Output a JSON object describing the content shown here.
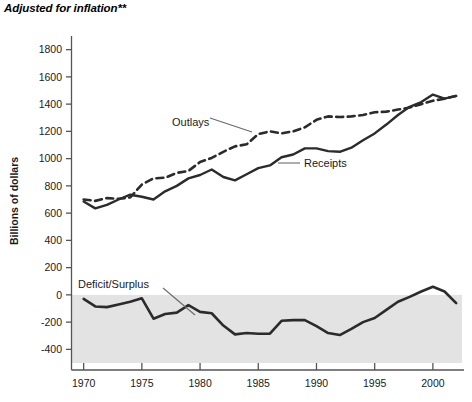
{
  "figure": {
    "title": "Adjusted for inflation**",
    "ylabel": "Billions of dollars"
  },
  "labels": {
    "outlays": "Outlays",
    "receipts": "Receipts",
    "deficit": "Deficit/Surplus"
  },
  "colors": {
    "line": "#2b2b2b",
    "shade": "#e3e3e3",
    "axis": "#555555",
    "text": "#1a1a1a"
  },
  "chart_data": {
    "type": "line",
    "title": "Adjusted for inflation**",
    "xlabel": "",
    "ylabel": "Billions of dollars",
    "xlim": [
      1969,
      2002.5
    ],
    "ylim": [
      -500,
      1900
    ],
    "xticks": [
      1970,
      1975,
      1980,
      1985,
      1990,
      1995,
      2000
    ],
    "xticklabels": [
      "1970",
      "1975",
      "1980",
      "1985",
      "1990",
      "1995",
      "2000"
    ],
    "yticks": [
      -400,
      -200,
      0,
      200,
      400,
      600,
      800,
      1000,
      1200,
      1400,
      1600,
      1800
    ],
    "yticklabels": [
      "-400",
      "-200",
      "0",
      "200",
      "400",
      "600",
      "800",
      "1000",
      "1200",
      "1400",
      "1600",
      "1800"
    ],
    "grid": false,
    "legend": "inline-annotations",
    "shaded_region": {
      "from": 0,
      "to": -500,
      "color": "#e3e3e3"
    },
    "x": [
      1970,
      1971,
      1972,
      1973,
      1974,
      1975,
      1976,
      1977,
      1978,
      1979,
      1980,
      1981,
      1982,
      1983,
      1984,
      1985,
      1986,
      1987,
      1988,
      1989,
      1990,
      1991,
      1992,
      1993,
      1994,
      1995,
      1996,
      1997,
      1998,
      1999,
      2000,
      2001,
      2002
    ],
    "series": [
      {
        "name": "Outlays",
        "style": "dashed",
        "values": [
          700,
          690,
          710,
          705,
          715,
          810,
          855,
          860,
          895,
          910,
          975,
          1005,
          1050,
          1090,
          1105,
          1180,
          1200,
          1185,
          1200,
          1230,
          1285,
          1310,
          1305,
          1310,
          1320,
          1340,
          1345,
          1360,
          1375,
          1400,
          1425,
          1440,
          1460
        ]
      },
      {
        "name": "Receipts",
        "style": "solid",
        "values": [
          685,
          635,
          660,
          700,
          735,
          720,
          700,
          760,
          800,
          855,
          880,
          920,
          865,
          840,
          885,
          930,
          950,
          1010,
          1030,
          1075,
          1075,
          1055,
          1050,
          1080,
          1135,
          1185,
          1250,
          1320,
          1380,
          1415,
          1470,
          1440,
          1460
        ]
      },
      {
        "name": "Deficit/Surplus",
        "style": "solid-shaded",
        "values": [
          -30,
          -85,
          -90,
          -70,
          -50,
          -25,
          -175,
          -140,
          -130,
          -75,
          -125,
          -135,
          -225,
          -290,
          -280,
          -285,
          -285,
          -190,
          -185,
          -185,
          -230,
          -280,
          -295,
          -250,
          -200,
          -170,
          -110,
          -50,
          -15,
          25,
          60,
          25,
          -60
        ]
      }
    ],
    "annotations": [
      {
        "text": "Outlays",
        "x": 1978.5,
        "y": 1225
      },
      {
        "text": "Receipts",
        "x": 1988.0,
        "y": 880
      },
      {
        "text": "Deficit/Surplus",
        "x": 1971.5,
        "y": 140
      }
    ]
  }
}
